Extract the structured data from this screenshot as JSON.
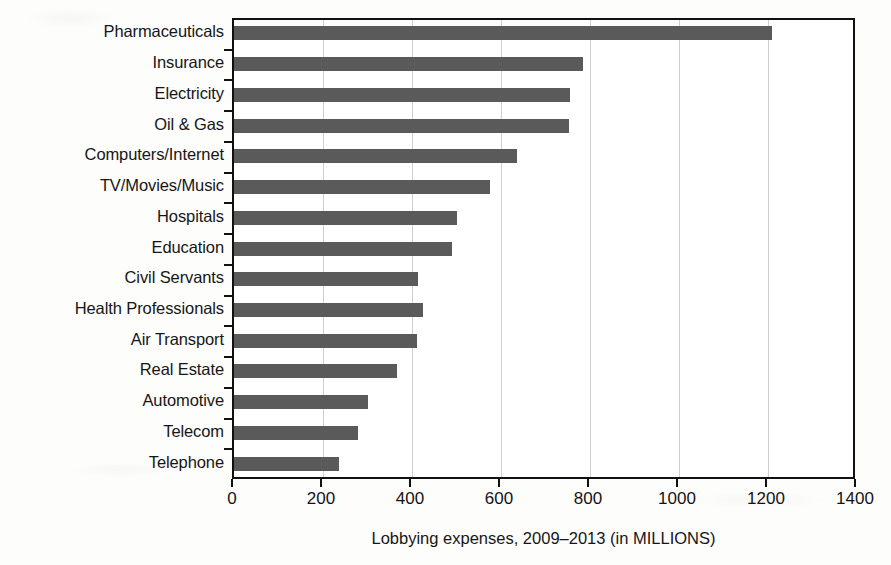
{
  "chart_data": {
    "type": "bar",
    "orientation": "horizontal",
    "title": "",
    "xlabel": "Lobbying expenses, 2009–2013 (in MILLIONS)",
    "ylabel": "",
    "xlim": [
      0,
      1400
    ],
    "xticks": [
      0,
      200,
      400,
      600,
      800,
      1000,
      1200,
      1400
    ],
    "xtick_labels": [
      "0",
      "200",
      "400",
      "600",
      "800",
      "1000",
      "1200",
      "1400"
    ],
    "grid": "vertical",
    "legend": "none",
    "bar_color": "#5a5a5a",
    "axis_color": "#111111",
    "gridline_color": "#cfcfcf",
    "categories": [
      "Pharmaceuticals",
      "Insurance",
      "Electricity",
      "Oil & Gas",
      "Computers/Internet",
      "TV/Movies/Music",
      "Hospitals",
      "Education",
      "Civil Servants",
      "Health Professionals",
      "Air Transport",
      "Real Estate",
      "Automotive",
      "Telecom",
      "Telephone"
    ],
    "values": [
      1210,
      785,
      755,
      752,
      635,
      575,
      500,
      490,
      413,
      424,
      411,
      366,
      301,
      279,
      236
    ],
    "series": [
      {
        "name": "Lobbying expenses",
        "values": [
          1210,
          785,
          755,
          752,
          635,
          575,
          500,
          490,
          413,
          424,
          411,
          366,
          301,
          279,
          236
        ]
      }
    ]
  }
}
